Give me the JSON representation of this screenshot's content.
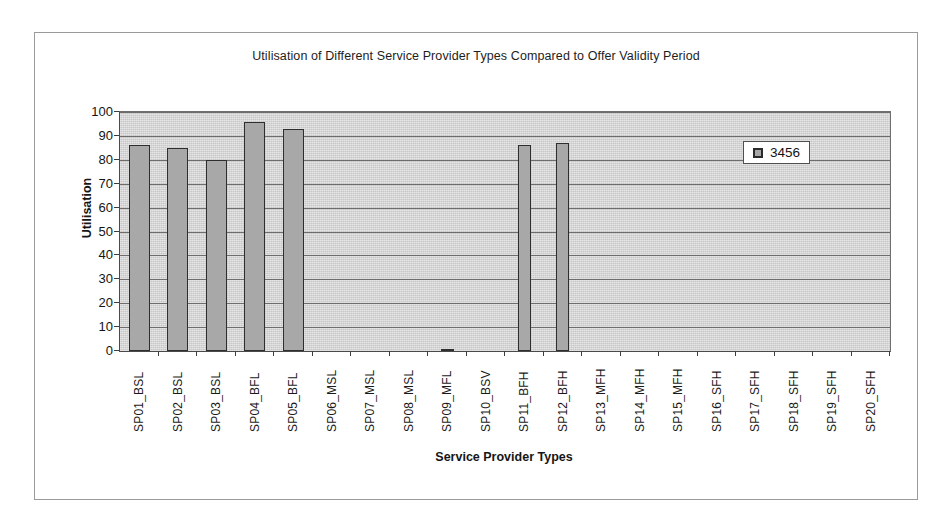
{
  "chart_data": {
    "type": "bar",
    "title": "Utilisation of Different Service Provider Types Compared to Offer Validity Period",
    "xlabel": "Service Provider Types",
    "ylabel": "Utilisation",
    "ylim": [
      0,
      100
    ],
    "ytick_step": 10,
    "yticks": [
      100,
      90,
      80,
      70,
      60,
      50,
      40,
      30,
      20,
      10,
      0
    ],
    "grid": true,
    "legend_position": "inside-top-right",
    "categories": [
      "SP01_BSL",
      "SP02_BSL",
      "SP03_BSL",
      "SP04_BFL",
      "SP05_BFL",
      "SP06_MSL",
      "SP07_MSL",
      "SP08_MSL",
      "SP09_MFL",
      "SP10_BSV",
      "SP11_BFH",
      "SP12_BFH",
      "SP13_MFH",
      "SP14_MFH",
      "SP15_MFH",
      "SP16_SFH",
      "SP17_SFH",
      "SP18_SFH",
      "SP19_SFH",
      "SP20_SFH"
    ],
    "series": [
      {
        "name": "3456",
        "color": "#a8a8a8",
        "values": [
          86,
          85,
          80,
          96,
          93,
          0,
          0,
          0,
          1,
          0,
          86,
          87,
          0,
          0,
          0,
          0,
          0,
          0,
          0,
          0
        ]
      }
    ],
    "legend": [
      {
        "label": "3456",
        "color": "#a8a8a8"
      }
    ]
  },
  "style": {
    "plot_background": "#d2d2d2",
    "gridline_color": "#6d6d6d",
    "axis_color": "#3d3d3d",
    "bar_fill": "#a8a8a8",
    "bar_border": "#2e2e2e",
    "frame_border": "#9a9a9a",
    "page_background": "#ffffff"
  }
}
